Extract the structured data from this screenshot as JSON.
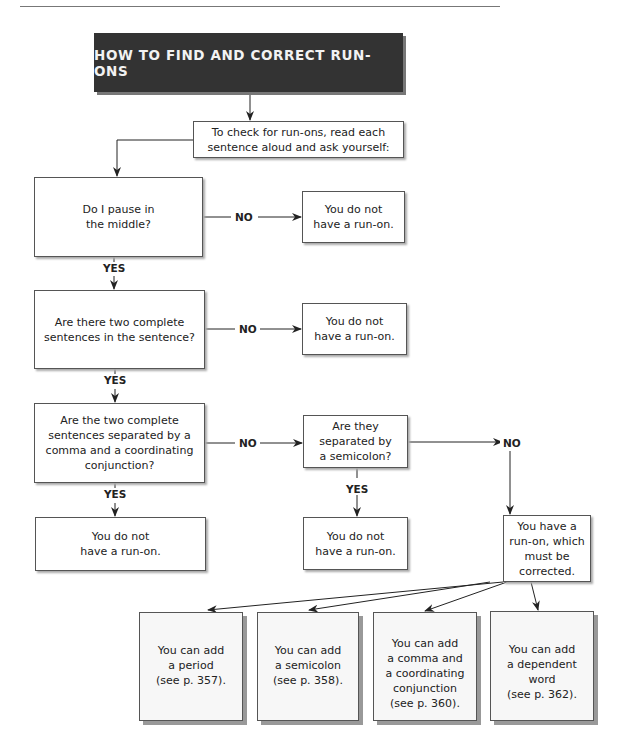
{
  "title": "HOW TO FIND AND CORRECT RUN-ONS",
  "start": "To check for run-ons, read each\nsentence aloud and ask yourself:",
  "questions": [
    {
      "text": "Do I pause in\nthe middle?",
      "no_result": "You do not\nhave a run-on."
    },
    {
      "text": "Are there two complete\nsentences in the sentence?",
      "no_result": "You do not\nhave a run-on."
    },
    {
      "text": "Are the two complete\nsentences separated by a\ncomma and a coordinating\nconjunction?",
      "yes_result": "You do not\nhave a run-on."
    }
  ],
  "semicolon_question": {
    "text": "Are they\nseparated by\na semicolon?",
    "yes_result": "You do not\nhave a run-on."
  },
  "runon_result": "You have a\nrun-on, which\nmust be corrected.",
  "labels": {
    "yes": "YES",
    "no": "NO"
  },
  "fixes": [
    {
      "text": "You can add\na period\n(see p. 357)."
    },
    {
      "text": "You can add\na semicolon\n(see p. 358)."
    },
    {
      "text": "You can add\na comma and\na coordinating\nconjunction\n(see p. 360)."
    },
    {
      "text": "You can add\na dependent\nword\n(see p. 362)."
    }
  ]
}
